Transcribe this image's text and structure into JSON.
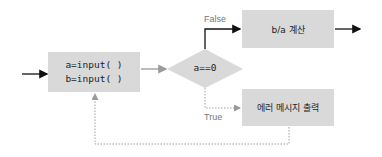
{
  "diagram": {
    "type": "flowchart",
    "nodes": {
      "input": {
        "lines": [
          "a=input( )",
          "b=input( )"
        ],
        "shape": "rectangle"
      },
      "condition": {
        "label": "a==0",
        "shape": "diamond"
      },
      "compute": {
        "label": "b/a 계산",
        "shape": "rectangle"
      },
      "error": {
        "label": "에러 메시지 출력",
        "shape": "rectangle"
      }
    },
    "edges": {
      "false_label": "False",
      "true_label": "True"
    },
    "colors": {
      "node_fill": "#d9d9d9",
      "solid_arrow": "#111111",
      "gray_arrow": "#9a9a9a",
      "dotted_arrow": "#a0a0a0",
      "label_text": "#777777"
    }
  }
}
